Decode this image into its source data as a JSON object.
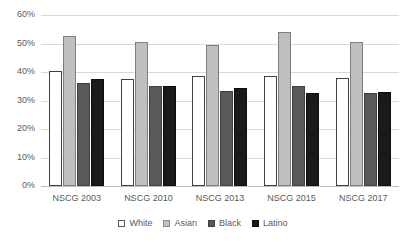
{
  "chart_data": {
    "type": "bar",
    "title": "",
    "xlabel": "",
    "ylabel": "",
    "ylim": [
      0,
      60
    ],
    "yticks": [
      0,
      10,
      20,
      30,
      40,
      50,
      60
    ],
    "ytick_labels": [
      "0%",
      "10%",
      "20%",
      "30%",
      "40%",
      "50%",
      "60%"
    ],
    "grid": true,
    "legend_position": "bottom",
    "categories": [
      "NSCG 2003",
      "NSCG 2010",
      "NSCG 2013",
      "NSCG 2015",
      "NSCG 2017"
    ],
    "series": [
      {
        "name": "White",
        "color": "#ffffff",
        "values": [
          40.5,
          37.5,
          38.5,
          38.5,
          38.0
        ]
      },
      {
        "name": "Asian",
        "color": "#bfbfbf",
        "values": [
          52.5,
          50.5,
          49.5,
          54.0,
          50.5
        ]
      },
      {
        "name": "Black",
        "color": "#595959",
        "values": [
          36.0,
          35.0,
          33.5,
          35.0,
          32.5
        ]
      },
      {
        "name": "Latino",
        "color": "#1a1a1a",
        "values": [
          37.5,
          35.0,
          34.5,
          32.5,
          33.0
        ]
      }
    ]
  },
  "legend": {
    "items": [
      {
        "label": "White"
      },
      {
        "label": "Asian"
      },
      {
        "label": "Black"
      },
      {
        "label": "Latino"
      }
    ]
  }
}
